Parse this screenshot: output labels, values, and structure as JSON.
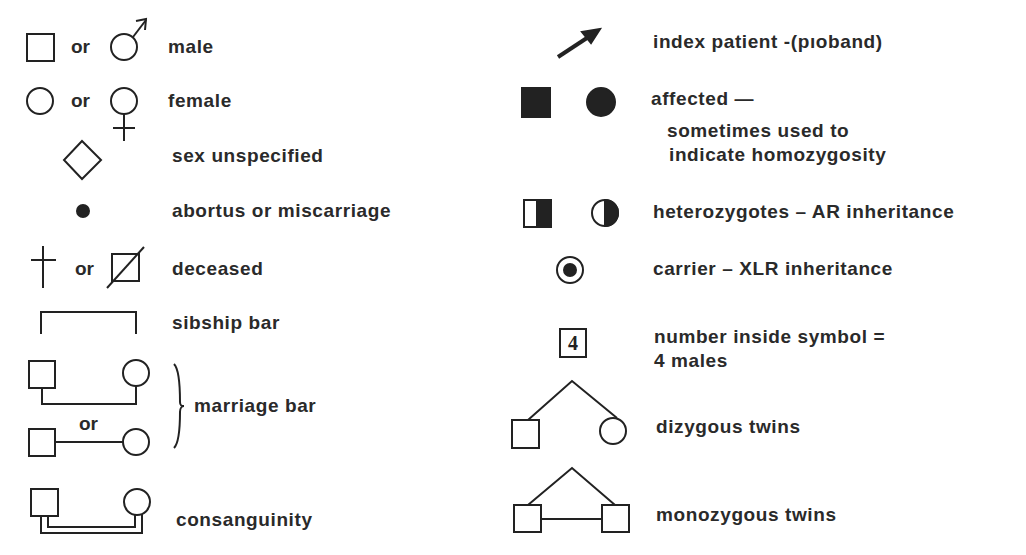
{
  "connector": "or",
  "left": [
    {
      "id": "male",
      "label": "male"
    },
    {
      "id": "female",
      "label": "female"
    },
    {
      "id": "sex-unspecified",
      "label": "sex unspecified"
    },
    {
      "id": "abortus",
      "label": "abortus or miscarriage"
    },
    {
      "id": "deceased",
      "label": "deceased"
    },
    {
      "id": "sibship-bar",
      "label": "sibship bar"
    },
    {
      "id": "marriage-bar",
      "label": "marriage bar"
    },
    {
      "id": "consanguinity",
      "label": "consanguinity"
    }
  ],
  "right": [
    {
      "id": "index-patient",
      "label": "index patient -(pıoband)"
    },
    {
      "id": "affected",
      "label": "affected —",
      "sub1": "sometimes used  to",
      "sub2": "indicate homozygosity"
    },
    {
      "id": "heterozygotes",
      "label": "heterozygotes – AR inheritance"
    },
    {
      "id": "carrier",
      "label": "carrier – XLR inheritance"
    },
    {
      "id": "number-inside",
      "label": "number inside symbol =",
      "sub1": "4 males",
      "symbol_number": "4"
    },
    {
      "id": "dizygous",
      "label": "dizygous  twins"
    },
    {
      "id": "monozygous",
      "label": "monozygous   twins"
    }
  ]
}
